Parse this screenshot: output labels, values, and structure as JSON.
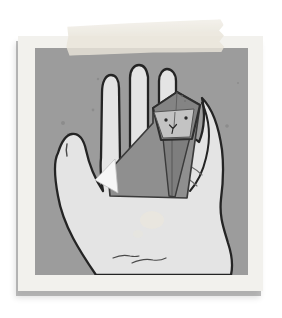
{
  "page": {
    "background": "#ffffff"
  },
  "polaroid": {
    "border_color": "#f2f1ed",
    "shadow_color": "#7d7d7d"
  },
  "tape": {
    "color": "#e9e5da"
  },
  "illustration": {
    "background": "#9c9c9c",
    "speckle_color": "#7f7f7f",
    "hand": {
      "fill": "#e4e4e4",
      "outline": "#242424",
      "crease_color": "#4a4a4a",
      "stain_color": "#ece7da"
    },
    "origami_cat": {
      "body": "#8f8f8f",
      "head_top": "#848484",
      "face": "#c3c3c3",
      "chest_shadow": "#7e7e7e",
      "white_fold": "#f6f6f6",
      "outline": "#3a3a3a",
      "eye_color": "#2b2b2b",
      "crease_color": "#5c5c5c"
    }
  }
}
